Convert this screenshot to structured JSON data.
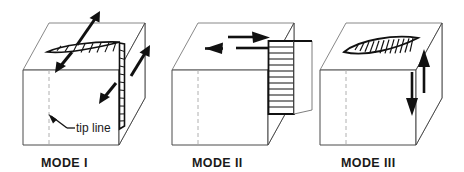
{
  "figure": {
    "background_color": "#ffffff",
    "line_color": "#1a1a1a",
    "light_line_color": "#6e6e6e",
    "dashed_line_color": "#9a9a9a",
    "fill_color": "#ffffff",
    "width": 464,
    "height": 172
  },
  "panels": [
    {
      "id": "mode-1",
      "label": "MODE I",
      "label_x": 78,
      "label_y": 163,
      "description": "Opening mode - crack faces pull apart perpendicular to crack plane",
      "annotation": {
        "text": "tip line",
        "x": 74,
        "y": 131
      },
      "arrow_count": 4,
      "crack_style": "lens-hatched",
      "crack_on_top": true,
      "crack_on_right": true
    },
    {
      "id": "mode-2",
      "label": "MODE II",
      "label_x": 222,
      "label_y": 163,
      "description": "Sliding mode - crack faces slide in-plane perpendicular to crack front",
      "arrow_count": 2,
      "crack_style": "offset-block-hatched",
      "crack_on_top": false,
      "crack_on_right": true
    },
    {
      "id": "mode-3",
      "label": "MODE III",
      "label_x": 372,
      "label_y": 163,
      "description": "Tearing mode - crack faces slide parallel to crack front",
      "arrow_count": 2,
      "crack_style": "lens-hatched",
      "crack_on_top": true,
      "crack_on_right": false
    }
  ]
}
